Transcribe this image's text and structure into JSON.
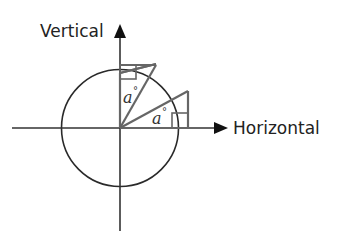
{
  "diagram": {
    "axes": {
      "vertical_label": "Vertical",
      "horizontal_label": "Horizontal"
    },
    "triangles": [
      {
        "name": "upper-triangle",
        "angle_label": "a",
        "degree_symbol": "°",
        "angle_vertex": "origin",
        "reference_axis": "vertical"
      },
      {
        "name": "lower-triangle",
        "angle_label": "a",
        "degree_symbol": "°",
        "angle_vertex": "origin",
        "reference_axis": "horizontal"
      }
    ],
    "colors": {
      "axis": "#333333",
      "circle": "#2a2a2a",
      "triangle": "#666666",
      "text": "#222222"
    }
  }
}
